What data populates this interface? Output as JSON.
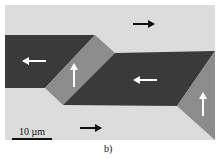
{
  "figure": {
    "scale_bar_label": "10 µm",
    "caption": "b)",
    "colors": {
      "background_domain": "#dcdcdc",
      "dark_domain": "#3a3a3a",
      "mid_domain": "#8c8c8c"
    },
    "arrows": [
      {
        "direction": "right",
        "color": "black"
      },
      {
        "direction": "left",
        "color": "white"
      },
      {
        "direction": "up",
        "color": "white"
      },
      {
        "direction": "left",
        "color": "white"
      },
      {
        "direction": "up",
        "color": "white"
      },
      {
        "direction": "right",
        "color": "black"
      }
    ]
  }
}
